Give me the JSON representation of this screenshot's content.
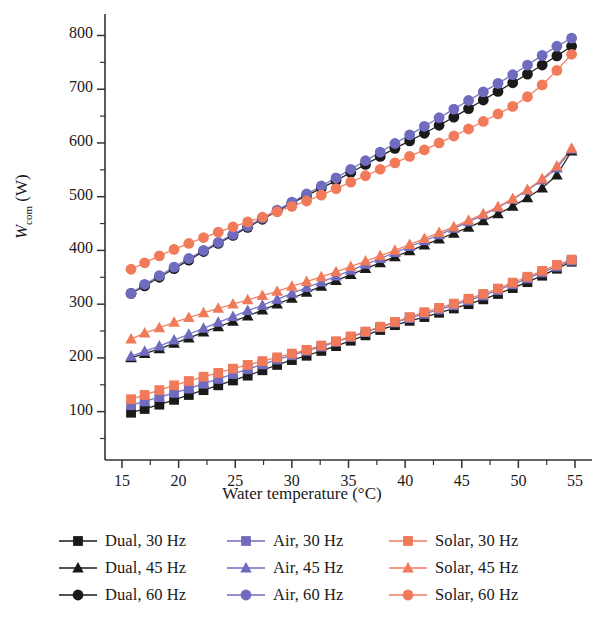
{
  "figure": {
    "x_axis_title": "Water temperature (°C)",
    "y_axis_symbol": "W",
    "y_axis_subscript": "com",
    "y_axis_unit": "(W)",
    "y_axis_title_full": "Wcom (W)"
  },
  "axes": {
    "x_ticks": [
      "15",
      "20",
      "25",
      "30",
      "35",
      "40",
      "45",
      "50",
      "55"
    ],
    "y_ticks": [
      "100",
      "200",
      "300",
      "400",
      "500",
      "600",
      "700",
      "800"
    ]
  },
  "legend": {
    "entries": [
      {
        "label": "Dual, 30 Hz",
        "color": "#1a1a1a",
        "marker": "square"
      },
      {
        "label": "Air, 30 Hz",
        "color": "#6f6bbf",
        "marker": "square"
      },
      {
        "label": "Solar, 30 Hz",
        "color": "#f07a5a",
        "marker": "square"
      },
      {
        "label": "Dual, 45 Hz",
        "color": "#1a1a1a",
        "marker": "triangle"
      },
      {
        "label": "Air, 45 Hz",
        "color": "#6f6bbf",
        "marker": "triangle"
      },
      {
        "label": "Solar, 45 Hz",
        "color": "#f07a5a",
        "marker": "triangle"
      },
      {
        "label": "Dual, 60 Hz",
        "color": "#1a1a1a",
        "marker": "circle"
      },
      {
        "label": "Air, 60 Hz",
        "color": "#6f6bbf",
        "marker": "circle"
      },
      {
        "label": "Solar, 60 Hz",
        "color": "#f07a5a",
        "marker": "circle"
      }
    ]
  },
  "chart_data": {
    "type": "scatter",
    "title": "",
    "xlabel": "Water temperature (°C)",
    "ylabel": "Wcom (W)",
    "xlim": [
      13.5,
      56.5
    ],
    "ylim": [
      10,
      840
    ],
    "xticks": [
      15,
      20,
      25,
      30,
      35,
      40,
      45,
      50,
      55
    ],
    "yticks": [
      100,
      200,
      300,
      400,
      500,
      600,
      700,
      800
    ],
    "grid": false,
    "legend_position": "below-axes",
    "minor_ticks": true,
    "series": [
      {
        "name": "Dual, 30 Hz",
        "color": "#1a1a1a",
        "marker": "square",
        "x": [
          15.8,
          17.0,
          18.3,
          19.6,
          20.9,
          22.2,
          23.5,
          24.8,
          26.1,
          27.4,
          28.7,
          30.0,
          31.3,
          32.6,
          33.9,
          35.2,
          36.5,
          37.8,
          39.1,
          40.4,
          41.7,
          43.0,
          44.3,
          45.6,
          46.9,
          48.2,
          49.5,
          50.8,
          52.1,
          53.4,
          54.7
        ],
        "y": [
          98,
          105,
          113,
          122,
          131,
          140,
          149,
          158,
          167,
          177,
          187,
          196,
          204,
          213,
          222,
          232,
          242,
          252,
          261,
          269,
          276,
          284,
          292,
          300,
          309,
          319,
          330,
          341,
          353,
          366,
          379
        ]
      },
      {
        "name": "Dual, 45 Hz",
        "color": "#1a1a1a",
        "marker": "triangle",
        "x": [
          15.8,
          17.0,
          18.3,
          19.6,
          20.9,
          22.2,
          23.5,
          24.8,
          26.1,
          27.4,
          28.7,
          30.0,
          31.3,
          32.6,
          33.9,
          35.2,
          36.5,
          37.8,
          39.1,
          40.4,
          41.7,
          43.0,
          44.3,
          45.6,
          46.9,
          48.2,
          49.5,
          50.8,
          52.1,
          53.4,
          54.7
        ],
        "y": [
          200,
          208,
          217,
          227,
          237,
          248,
          258,
          268,
          278,
          289,
          300,
          311,
          322,
          333,
          344,
          355,
          366,
          377,
          388,
          399,
          410,
          421,
          432,
          443,
          455,
          468,
          482,
          498,
          516,
          540,
          585
        ]
      },
      {
        "name": "Dual, 60 Hz",
        "color": "#1a1a1a",
        "marker": "circle",
        "x": [
          15.8,
          17.0,
          18.3,
          19.6,
          20.9,
          22.2,
          23.5,
          24.8,
          26.1,
          27.4,
          28.7,
          30.0,
          31.3,
          32.6,
          33.9,
          35.2,
          36.5,
          37.8,
          39.1,
          40.4,
          41.7,
          43.0,
          44.3,
          45.6,
          46.9,
          48.2,
          49.5,
          50.8,
          52.1,
          53.4,
          54.7
        ],
        "y": [
          320,
          334,
          350,
          366,
          382,
          398,
          413,
          428,
          443,
          458,
          473,
          488,
          502,
          516,
          530,
          545,
          560,
          575,
          590,
          604,
          618,
          633,
          648,
          664,
          680,
          696,
          712,
          728,
          745,
          762,
          780
        ]
      },
      {
        "name": "Air, 30 Hz",
        "color": "#6f6bbf",
        "marker": "square",
        "x": [
          15.8,
          17.0,
          18.3,
          19.6,
          20.9,
          22.2,
          23.5,
          24.8,
          26.1,
          27.4,
          28.7,
          30.0,
          31.3,
          32.6,
          33.9,
          35.2,
          36.5,
          37.8,
          39.1,
          40.4,
          41.7,
          43.0,
          44.3,
          45.6,
          46.9,
          48.2,
          49.5,
          50.8,
          52.1,
          53.4,
          54.7
        ],
        "y": [
          112,
          119,
          127,
          135,
          143,
          152,
          161,
          170,
          179,
          188,
          197,
          205,
          213,
          221,
          230,
          239,
          248,
          257,
          266,
          274,
          282,
          290,
          298,
          307,
          316,
          326,
          337,
          348,
          359,
          370,
          381
        ]
      },
      {
        "name": "Air, 45 Hz",
        "color": "#6f6bbf",
        "marker": "triangle",
        "x": [
          15.8,
          17.0,
          18.3,
          19.6,
          20.9,
          22.2,
          23.5,
          24.8,
          26.1,
          27.4,
          28.7,
          30.0,
          31.3,
          32.6,
          33.9,
          35.2,
          36.5,
          37.8,
          39.1,
          40.4,
          41.7,
          43.0,
          44.3,
          45.6,
          46.9,
          48.2,
          49.5,
          50.8,
          52.1,
          53.4,
          54.7
        ],
        "y": [
          203,
          212,
          222,
          233,
          244,
          255,
          266,
          277,
          288,
          298,
          309,
          320,
          331,
          341,
          352,
          363,
          374,
          385,
          396,
          407,
          418,
          429,
          441,
          453,
          466,
          480,
          495,
          512,
          531,
          553,
          588
        ]
      },
      {
        "name": "Air, 60 Hz",
        "color": "#6f6bbf",
        "marker": "circle",
        "x": [
          15.8,
          17.0,
          18.3,
          19.6,
          20.9,
          22.2,
          23.5,
          24.8,
          26.1,
          27.4,
          28.7,
          30.0,
          31.3,
          32.6,
          33.9,
          35.2,
          36.5,
          37.8,
          39.1,
          40.4,
          41.7,
          43.0,
          44.3,
          45.6,
          46.9,
          48.2,
          49.5,
          50.8,
          52.1,
          53.4,
          54.7
        ],
        "y": [
          320,
          337,
          353,
          369,
          385,
          400,
          415,
          430,
          445,
          460,
          475,
          490,
          505,
          520,
          535,
          551,
          567,
          583,
          599,
          615,
          631,
          647,
          663,
          679,
          695,
          711,
          727,
          745,
          763,
          780,
          795
        ]
      },
      {
        "name": "Solar, 30 Hz",
        "color": "#f07a5a",
        "marker": "square",
        "x": [
          15.8,
          17.0,
          18.3,
          19.6,
          20.9,
          22.2,
          23.5,
          24.8,
          26.1,
          27.4,
          28.7,
          30.0,
          31.3,
          32.6,
          33.9,
          35.2,
          36.5,
          37.8,
          39.1,
          40.4,
          41.7,
          43.0,
          44.3,
          45.6,
          46.9,
          48.2,
          49.5,
          50.8,
          52.1,
          53.4,
          54.7
        ],
        "y": [
          123,
          131,
          140,
          149,
          157,
          165,
          172,
          180,
          187,
          194,
          201,
          208,
          215,
          223,
          231,
          240,
          249,
          258,
          267,
          276,
          285,
          293,
          301,
          310,
          319,
          329,
          340,
          351,
          362,
          373,
          383
        ]
      },
      {
        "name": "Solar, 45 Hz",
        "color": "#f07a5a",
        "marker": "triangle",
        "x": [
          15.8,
          17.0,
          18.3,
          19.6,
          20.9,
          22.2,
          23.5,
          24.8,
          26.1,
          27.4,
          28.7,
          30.0,
          31.3,
          32.6,
          33.9,
          35.2,
          36.5,
          37.8,
          39.1,
          40.4,
          41.7,
          43.0,
          44.3,
          45.6,
          46.9,
          48.2,
          49.5,
          50.8,
          52.1,
          53.4,
          54.7
        ],
        "y": [
          235,
          246,
          256,
          266,
          275,
          284,
          292,
          300,
          308,
          316,
          324,
          333,
          342,
          351,
          360,
          370,
          380,
          390,
          400,
          411,
          422,
          433,
          444,
          456,
          468,
          481,
          496,
          513,
          533,
          557,
          590
        ]
      },
      {
        "name": "Solar, 60 Hz",
        "color": "#f07a5a",
        "marker": "circle",
        "x": [
          15.8,
          17.0,
          18.3,
          19.6,
          20.9,
          22.2,
          23.5,
          24.8,
          26.1,
          27.4,
          28.7,
          30.0,
          31.3,
          32.6,
          33.9,
          35.2,
          36.5,
          37.8,
          39.1,
          40.4,
          41.7,
          43.0,
          44.3,
          45.6,
          46.9,
          48.2,
          49.5,
          50.8,
          52.1,
          53.4,
          54.7
        ],
        "y": [
          365,
          377,
          390,
          402,
          413,
          424,
          434,
          444,
          453,
          462,
          472,
          482,
          492,
          503,
          515,
          527,
          539,
          551,
          563,
          575,
          587,
          600,
          613,
          626,
          640,
          654,
          668,
          686,
          708,
          735,
          765
        ]
      }
    ]
  }
}
